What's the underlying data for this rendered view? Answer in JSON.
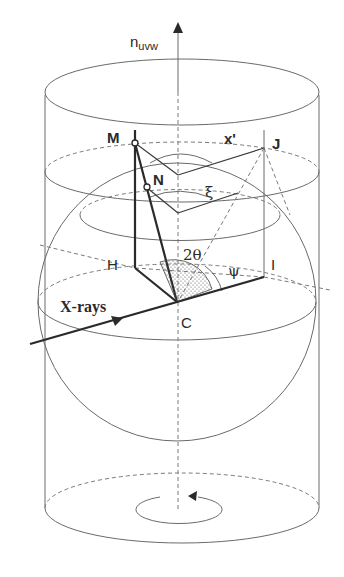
{
  "figure": {
    "axis_label": {
      "main": "n",
      "subscript": "uvw"
    },
    "points": {
      "M": "M",
      "N": "N",
      "J": "J",
      "H": "H",
      "I": "I",
      "C": "C",
      "x_prime": "x'"
    },
    "angles": {
      "two_theta": "2θ",
      "psi": "ψ",
      "xi": "ξ"
    },
    "beam_label": "X-rays",
    "colors": {
      "line": "#2a2a2a",
      "thin_line": "#6a6a6a",
      "dashed": "#7a7a7a",
      "stipple": "#555555",
      "background": "#ffffff"
    }
  }
}
